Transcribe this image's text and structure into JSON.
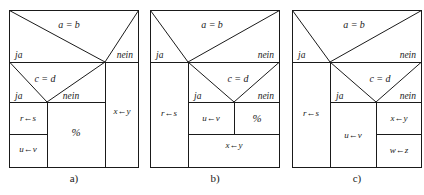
{
  "figure": {
    "panel_count": 3,
    "line_color": "#1a1a1a",
    "background_color": "#ffffff"
  },
  "labels": {
    "yes": "ja",
    "no": "nein",
    "cond_outer": "a = b",
    "cond_inner": "c = d",
    "empty": "%",
    "assign_rs": "r←s",
    "assign_uv": "u←v",
    "assign_xy": "x←y",
    "assign_wz": "w←z"
  },
  "panels": [
    {
      "id": "a",
      "caption": "a)",
      "outer_condition": "a = b",
      "outer_yes": "ja",
      "outer_no": "nein",
      "inner_condition": "c = d",
      "inner_yes": "ja",
      "inner_no": "nein",
      "blocks": [
        {
          "name": "assign-rs",
          "text": "r←s"
        },
        {
          "name": "assign-uv",
          "text": "u←v"
        },
        {
          "name": "empty-statement",
          "text": "%"
        },
        {
          "name": "assign-xy",
          "text": "x←y"
        }
      ]
    },
    {
      "id": "b",
      "caption": "b)",
      "outer_condition": "a = b",
      "outer_yes": "ja",
      "outer_no": "nein",
      "inner_condition": "c = d",
      "inner_yes": "ja",
      "inner_no": "nein",
      "blocks": [
        {
          "name": "assign-rs",
          "text": "r←s"
        },
        {
          "name": "assign-uv",
          "text": "u←v"
        },
        {
          "name": "empty-statement",
          "text": "%"
        },
        {
          "name": "assign-xy",
          "text": "x←y"
        }
      ]
    },
    {
      "id": "c",
      "caption": "c)",
      "outer_condition": "a = b",
      "outer_yes": "ja",
      "outer_no": "nein",
      "inner_condition": "c = d",
      "inner_yes": "ja",
      "inner_no": "nein",
      "blocks": [
        {
          "name": "assign-rs",
          "text": "r←s"
        },
        {
          "name": "assign-uv",
          "text": "u←v"
        },
        {
          "name": "assign-xy",
          "text": "x←y"
        },
        {
          "name": "assign-wz",
          "text": "w←z"
        }
      ]
    }
  ]
}
